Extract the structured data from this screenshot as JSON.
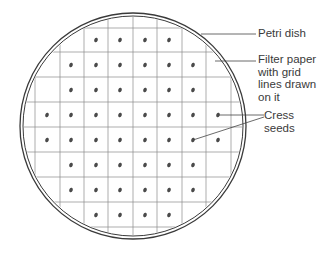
{
  "diagram": {
    "dish": {
      "cx": 133,
      "cy": 126,
      "r_outer": 113,
      "r_inner": 110
    },
    "grid": {
      "x_lines": [
        35,
        60,
        84,
        108,
        133,
        157,
        182,
        206,
        231
      ],
      "y_lines": [
        28,
        52,
        77,
        102,
        127,
        152,
        177,
        202,
        227
      ]
    },
    "seed_rows": [
      {
        "y": 40,
        "xs": [
          96,
          120,
          145,
          169
        ]
      },
      {
        "y": 65,
        "xs": [
          71,
          96,
          120,
          145,
          169,
          193
        ]
      },
      {
        "y": 90,
        "xs": [
          71,
          96,
          120,
          145,
          169,
          193
        ]
      },
      {
        "y": 115,
        "xs": [
          47,
          71,
          96,
          120,
          145,
          169,
          193,
          218
        ]
      },
      {
        "y": 140,
        "xs": [
          47,
          71,
          96,
          120,
          145,
          169,
          193,
          218
        ]
      },
      {
        "y": 165,
        "xs": [
          71,
          96,
          120,
          145,
          169,
          193
        ]
      },
      {
        "y": 190,
        "xs": [
          71,
          96,
          120,
          145,
          169,
          193
        ]
      },
      {
        "y": 215,
        "xs": [
          96,
          120,
          145,
          169
        ]
      }
    ],
    "colors": {
      "line": "#3a3a3a",
      "grid": "#8a8a8a",
      "seed": "#4a4a4a"
    }
  },
  "labels": {
    "petri_dish": "Petri dish",
    "filter_paper": "Filter paper\nwith grid\nlines drawn\non it",
    "cress_seeds": "Cress\nseeds"
  }
}
